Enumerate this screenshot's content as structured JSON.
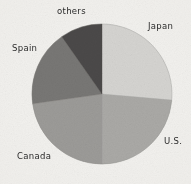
{
  "figure": {
    "background_color": "#f2f1ee",
    "text_color": "#2a2a2a"
  },
  "chart_data": {
    "type": "pie",
    "title": "",
    "xlabel": "",
    "ylabel": "",
    "legend_position": "none",
    "labels_position": "outside",
    "grid": false,
    "start_angle_deg": 0,
    "direction": "clockwise",
    "center": {
      "x": 102,
      "y": 94
    },
    "radius": 70,
    "categories": [
      "Japan",
      "U.S.",
      "Canada",
      "Spain",
      "others"
    ],
    "values": [
      26,
      24,
      23,
      17,
      10
    ],
    "units": "percent",
    "slices": [
      {
        "label": "Japan",
        "value": 26,
        "start_angle_deg": 0,
        "end_angle_deg": 95,
        "color": "#d5d4d1"
      },
      {
        "label": "U.S.",
        "value": 24,
        "start_angle_deg": 95,
        "end_angle_deg": 180,
        "color": "#aaa9a6"
      },
      {
        "label": "Canada",
        "value": 23,
        "start_angle_deg": 180,
        "end_angle_deg": 262,
        "color": "#9c9b98"
      },
      {
        "label": "Spain",
        "value": 17,
        "start_angle_deg": 262,
        "end_angle_deg": 325,
        "color": "#787774"
      },
      {
        "label": "others",
        "value": 10,
        "start_angle_deg": 325,
        "end_angle_deg": 360,
        "color": "#4b4a48"
      }
    ]
  },
  "labels": {
    "japan": "Japan",
    "us": "U.S.",
    "canada": "Canada",
    "spain": "Spain",
    "others": "others"
  }
}
